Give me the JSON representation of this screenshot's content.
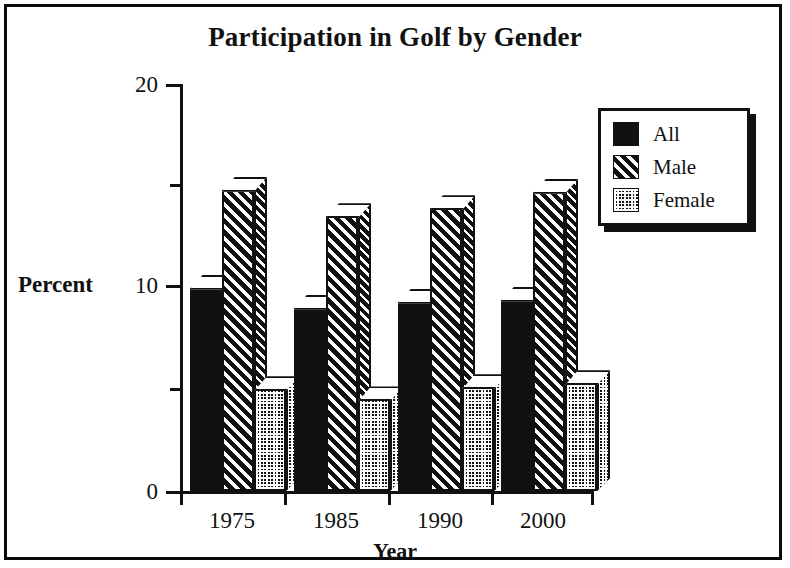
{
  "figure": {
    "title": "Participation in Golf by Gender",
    "frame_color": "#111111",
    "background": "#ffffff"
  },
  "chart_data": {
    "type": "bar",
    "title": "Participation in Golf by Gender",
    "xlabel": "Year",
    "ylabel": "Percent",
    "categories": [
      "1975",
      "1985",
      "1990",
      "2000"
    ],
    "series": [
      {
        "name": "All",
        "pattern": "solid",
        "values": [
          10.0,
          9.0,
          9.3,
          9.4
        ]
      },
      {
        "name": "Male",
        "pattern": "diagonal-hatch",
        "values": [
          14.8,
          13.5,
          13.9,
          14.7
        ]
      },
      {
        "name": "Female",
        "pattern": "dot-grid",
        "values": [
          5.0,
          4.5,
          5.1,
          5.3
        ]
      }
    ],
    "ylim": [
      0,
      20
    ],
    "y_major_ticks": [
      "0",
      "10",
      "20"
    ],
    "y_minor_ticks": [
      5,
      15
    ],
    "grid": false,
    "legend_position": "top-right",
    "style": "3d-bars-monochrome"
  },
  "axes": {
    "y_title": "Percent",
    "x_title": "Year",
    "y_labels": [
      "20",
      "10",
      "0"
    ],
    "x_labels": [
      "1975",
      "1985",
      "1990",
      "2000"
    ]
  },
  "legend": {
    "items": [
      {
        "label": "All"
      },
      {
        "label": "Male"
      },
      {
        "label": "Female"
      }
    ]
  }
}
